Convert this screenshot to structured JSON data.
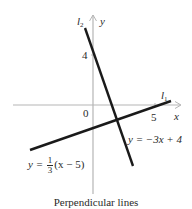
{
  "diagram": {
    "caption": "Perpendicular lines",
    "axes": {
      "x_label": "x",
      "y_label": "y",
      "origin_label": "0",
      "x_tick_label": "5",
      "y_tick_label": "4"
    },
    "lines": [
      {
        "id": "l1",
        "name_main": "l",
        "name_sub": "1",
        "equation_prefix": "y = ",
        "equation_frac_num": "1",
        "equation_frac_den": "3",
        "equation_suffix": "(x − 5)",
        "slope": "1/3",
        "color": "#1a1a1a"
      },
      {
        "id": "l2",
        "name_main": "l",
        "name_sub": "2",
        "equation": "y = −3x + 4",
        "slope": "-3",
        "color": "#1a1a1a"
      }
    ],
    "colors": {
      "axis": "#b5b5b5",
      "line": "#1a1a1a",
      "text": "#2a2a2a",
      "background": "#ffffff"
    }
  }
}
